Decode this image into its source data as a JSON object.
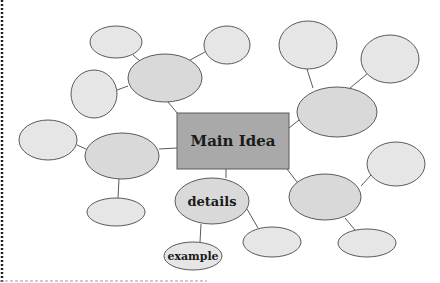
{
  "diagram": {
    "type": "mind-map",
    "colors": {
      "background": "#ffffff",
      "bubble_fill": "#e6e6e6",
      "bubble_fill_dark": "#d9d9d9",
      "main_fill": "#a9a9a9",
      "stroke": "#5a5a5a",
      "border": "#222222"
    },
    "main": {
      "label": "Main Idea",
      "x": 177,
      "y": 113,
      "w": 112,
      "h": 56
    },
    "nodes": [
      {
        "id": "n1",
        "label": "",
        "cx": 116,
        "cy": 42,
        "rx": 26,
        "ry": 16,
        "shade": "light"
      },
      {
        "id": "n2",
        "label": "",
        "cx": 227,
        "cy": 45,
        "rx": 23,
        "ry": 19,
        "shade": "light"
      },
      {
        "id": "n3",
        "label": "",
        "cx": 165,
        "cy": 78,
        "rx": 37,
        "ry": 24,
        "shade": "dark"
      },
      {
        "id": "n4",
        "label": "",
        "cx": 94,
        "cy": 94,
        "rx": 23,
        "ry": 24,
        "shade": "light"
      },
      {
        "id": "n5",
        "label": "",
        "cx": 308,
        "cy": 45,
        "rx": 29,
        "ry": 24,
        "shade": "light"
      },
      {
        "id": "n6",
        "label": "",
        "cx": 390,
        "cy": 59,
        "rx": 29,
        "ry": 24,
        "shade": "light"
      },
      {
        "id": "n7",
        "label": "",
        "cx": 337,
        "cy": 112,
        "rx": 40,
        "ry": 25,
        "shade": "dark"
      },
      {
        "id": "n8",
        "label": "",
        "cx": 48,
        "cy": 140,
        "rx": 29,
        "ry": 20,
        "shade": "light"
      },
      {
        "id": "n9",
        "label": "",
        "cx": 122,
        "cy": 156,
        "rx": 37,
        "ry": 23,
        "shade": "dark"
      },
      {
        "id": "n10",
        "label": "",
        "cx": 116,
        "cy": 212,
        "rx": 29,
        "ry": 14,
        "shade": "light"
      },
      {
        "id": "n11",
        "label": "details",
        "cx": 212,
        "cy": 201,
        "rx": 37,
        "ry": 23,
        "shade": "dark"
      },
      {
        "id": "n12",
        "label": "example",
        "cx": 193,
        "cy": 256,
        "rx": 29,
        "ry": 14,
        "shade": "light"
      },
      {
        "id": "n13",
        "label": "",
        "cx": 272,
        "cy": 242,
        "rx": 29,
        "ry": 15,
        "shade": "light"
      },
      {
        "id": "n14",
        "label": "",
        "cx": 325,
        "cy": 197,
        "rx": 36,
        "ry": 23,
        "shade": "dark"
      },
      {
        "id": "n15",
        "label": "",
        "cx": 396,
        "cy": 164,
        "rx": 29,
        "ry": 22,
        "shade": "light"
      },
      {
        "id": "n16",
        "label": "",
        "cx": 367,
        "cy": 243,
        "rx": 29,
        "ry": 14,
        "shade": "light"
      }
    ],
    "edges": [
      {
        "x1": 133,
        "y1": 55,
        "x2": 140,
        "y2": 61
      },
      {
        "x1": 190,
        "y1": 60,
        "x2": 205,
        "y2": 52
      },
      {
        "x1": 117,
        "y1": 90,
        "x2": 128,
        "y2": 86
      },
      {
        "x1": 168,
        "y1": 102,
        "x2": 178,
        "y2": 114
      },
      {
        "x1": 307,
        "y1": 69,
        "x2": 313,
        "y2": 88
      },
      {
        "x1": 367,
        "y1": 74,
        "x2": 350,
        "y2": 88
      },
      {
        "x1": 289,
        "y1": 128,
        "x2": 299,
        "y2": 120
      },
      {
        "x1": 77,
        "y1": 145,
        "x2": 86,
        "y2": 149
      },
      {
        "x1": 159,
        "y1": 149,
        "x2": 177,
        "y2": 148
      },
      {
        "x1": 119,
        "y1": 179,
        "x2": 118,
        "y2": 198
      },
      {
        "x1": 226,
        "y1": 169,
        "x2": 226,
        "y2": 178
      },
      {
        "x1": 201,
        "y1": 224,
        "x2": 200,
        "y2": 242
      },
      {
        "x1": 247,
        "y1": 209,
        "x2": 258,
        "y2": 228
      },
      {
        "x1": 287,
        "y1": 169,
        "x2": 297,
        "y2": 182
      },
      {
        "x1": 361,
        "y1": 186,
        "x2": 371,
        "y2": 175
      },
      {
        "x1": 345,
        "y1": 218,
        "x2": 355,
        "y2": 230
      }
    ],
    "frame": {
      "left_border": {
        "x": 2,
        "y1": 0,
        "y2": 283
      },
      "bottom_border": {
        "y": 281,
        "x1": 0,
        "x2": 207
      }
    }
  }
}
